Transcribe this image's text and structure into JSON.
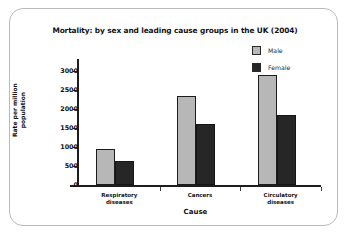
{
  "chart_data": {
    "type": "bar",
    "title": "Mortality: by sex and leading cause groups in the UK (2004)",
    "xlabel": "Cause",
    "ylabel": "Rate per million population",
    "categories": [
      "Respiratory diseases",
      "Cancers",
      "Circulatory diseases"
    ],
    "category_lines": [
      [
        "Respiratory",
        "diseases"
      ],
      [
        "Cancers",
        ""
      ],
      [
        "Circulatory",
        "diseases"
      ]
    ],
    "series": [
      {
        "name": "Male",
        "color": "#b7b7b7",
        "values": [
          950,
          2350,
          2900
        ]
      },
      {
        "name": "Female",
        "color": "#262626",
        "values": [
          620,
          1600,
          1850
        ]
      }
    ],
    "ylim": [
      0,
      3000
    ],
    "yticks": [
      0,
      500,
      1000,
      1500,
      2000,
      2500,
      3000
    ],
    "ytick_labels": [
      "0",
      "500",
      "1000",
      "1500",
      "2000",
      "2500",
      "3000"
    ],
    "grid": false,
    "legend_position": "top-right"
  },
  "legend": {
    "items": [
      {
        "label": "Male"
      },
      {
        "label": "Female"
      }
    ]
  }
}
